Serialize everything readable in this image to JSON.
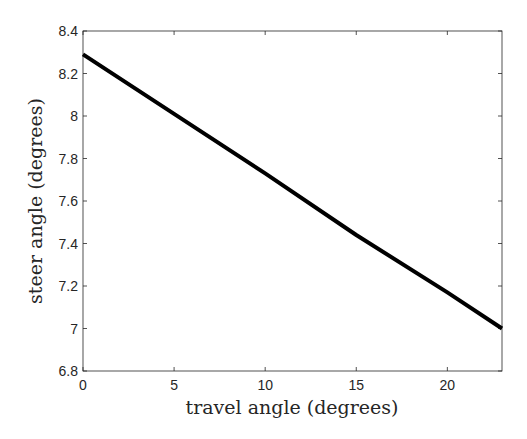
{
  "chart_data": {
    "type": "line",
    "title": "",
    "xlabel": "travel angle (degrees)",
    "ylabel": "steer angle (degrees)",
    "xlim": [
      0,
      23
    ],
    "ylim": [
      6.8,
      8.4
    ],
    "xticks": [
      "0",
      "5",
      "10",
      "15",
      "20"
    ],
    "yticks": [
      "6.8",
      "7",
      "7.2",
      "7.4",
      "7.6",
      "7.8",
      "8",
      "8.2",
      "8.4"
    ],
    "grid": false,
    "legend": null,
    "series": [
      {
        "name": "steer angle",
        "color": "#000000",
        "x": [
          0,
          5,
          10,
          15,
          20,
          23
        ],
        "y": [
          8.29,
          8.01,
          7.73,
          7.44,
          7.17,
          7.0
        ]
      }
    ]
  }
}
